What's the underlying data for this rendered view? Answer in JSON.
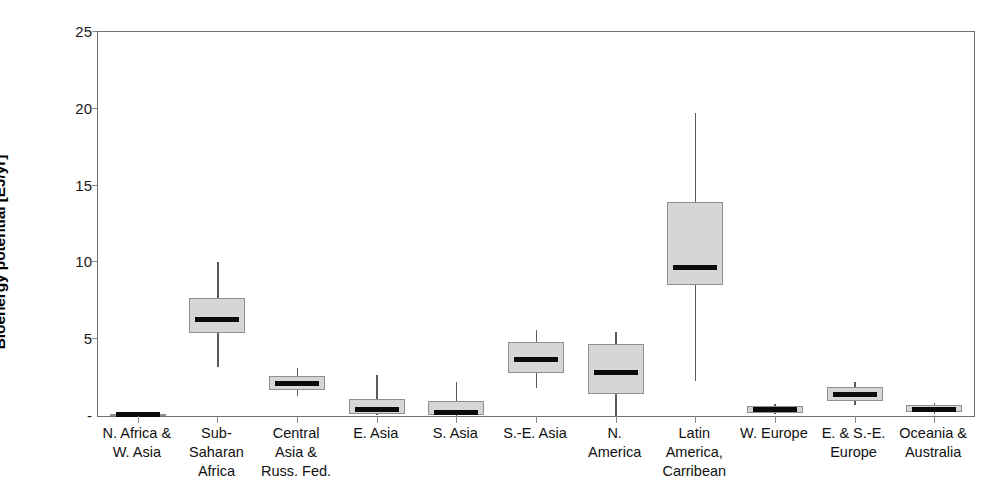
{
  "chart_data": {
    "type": "box",
    "title": "",
    "xlabel": "",
    "ylabel": "Bioenergy potential [EJ/yr]",
    "ylim": [
      0,
      25
    ],
    "yticks": [
      0,
      5,
      10,
      15,
      20,
      25
    ],
    "ytick_labels": [
      "-",
      "5",
      "10",
      "15",
      "20",
      "25"
    ],
    "grid": false,
    "legend": "none",
    "categories": [
      "N. Africa &\nW. Asia",
      "Sub-\nSaharan\nAfrica",
      "Central\nAsia &\nRuss. Fed.",
      "E. Asia",
      "S. Asia",
      "S.-E. Asia",
      "N.\nAmerica",
      "Latin\nAmerica,\nCarribean",
      "W. Europe",
      "E. & S.-E.\nEurope",
      "Oceania &\nAustralia"
    ],
    "boxes": [
      {
        "name": "N. Africa & W. Asia",
        "whisker_low": 0.05,
        "q1": 0.05,
        "median": 0.1,
        "q3": 0.15,
        "whisker_high": 0.2
      },
      {
        "name": "Sub-Saharan Africa",
        "whisker_low": 3.2,
        "q1": 5.4,
        "median": 6.3,
        "q3": 7.7,
        "whisker_high": 10.0
      },
      {
        "name": "Central Asia & Russ. Fed.",
        "whisker_low": 1.3,
        "q1": 1.7,
        "median": 2.1,
        "q3": 2.6,
        "whisker_high": 3.1
      },
      {
        "name": "E. Asia",
        "whisker_low": 0.05,
        "q1": 0.1,
        "median": 0.45,
        "q3": 1.1,
        "whisker_high": 2.7
      },
      {
        "name": "S. Asia",
        "whisker_low": 0.0,
        "q1": 0.05,
        "median": 0.2,
        "q3": 0.95,
        "whisker_high": 2.2
      },
      {
        "name": "S.-E. Asia",
        "whisker_low": 1.8,
        "q1": 2.8,
        "median": 3.7,
        "q3": 4.8,
        "whisker_high": 5.6
      },
      {
        "name": "N. America",
        "whisker_low": 0.0,
        "q1": 1.4,
        "median": 2.8,
        "q3": 4.7,
        "whisker_high": 5.5
      },
      {
        "name": "Latin America, Carribean",
        "whisker_low": 2.3,
        "q1": 8.5,
        "median": 9.7,
        "q3": 13.9,
        "whisker_high": 19.7
      },
      {
        "name": "W. Europe",
        "whisker_low": 0.1,
        "q1": 0.2,
        "median": 0.4,
        "q3": 0.65,
        "whisker_high": 0.8
      },
      {
        "name": "E. & S.-E. Europe",
        "whisker_low": 0.7,
        "q1": 1.0,
        "median": 1.4,
        "q3": 1.9,
        "whisker_high": 2.2
      },
      {
        "name": "Oceania & Australia",
        "whisker_low": 0.15,
        "q1": 0.25,
        "median": 0.45,
        "q3": 0.7,
        "whisker_high": 0.85
      }
    ],
    "colors": {
      "box_fill": "#d6d6d6",
      "box_edge": "#8f8f8f",
      "median": "#0b0b0b",
      "whisker": "#5a5a5a",
      "axis": "#6e6e6e",
      "background": "#ffffff"
    }
  },
  "axis": {
    "y_title": "Bioenergy potential [EJ/yr]"
  }
}
